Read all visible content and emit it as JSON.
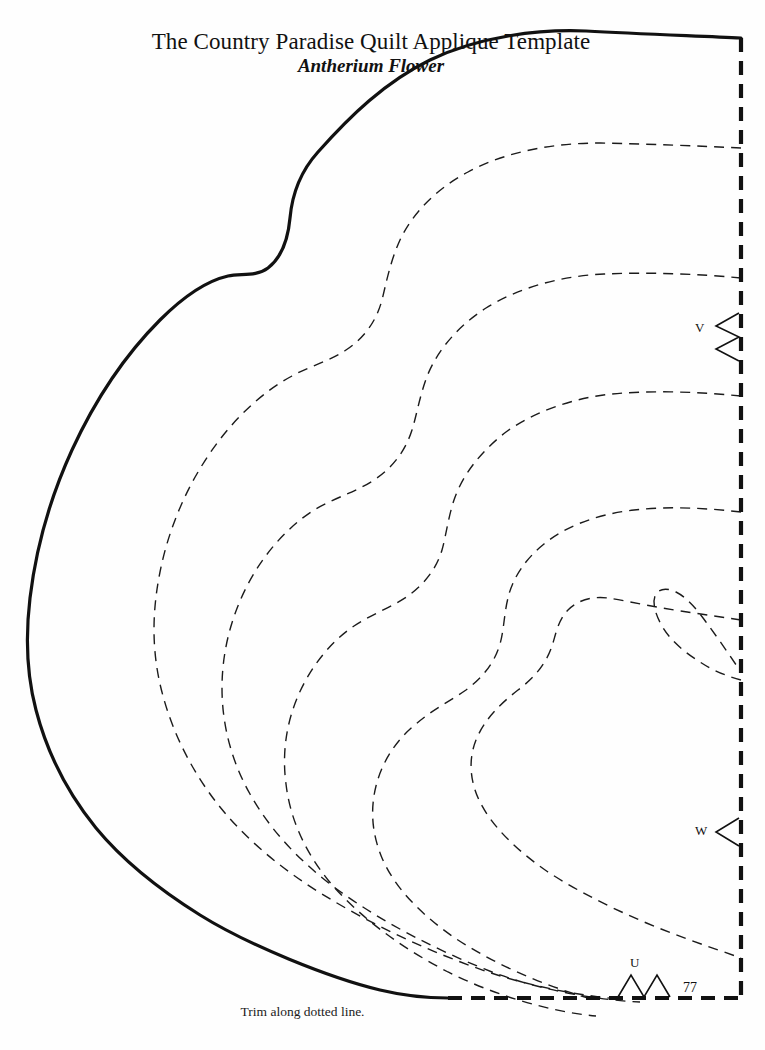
{
  "document": {
    "title_main": "The Country Paradise Quilt Applique Template",
    "title_sub": "Antherium Flower",
    "trim_caption": "Trim along dotted line.",
    "page_number": "77",
    "background_color": "#fefefe",
    "ink_color": "#111111"
  },
  "markers": [
    {
      "id": "V",
      "label": "V",
      "notches": 2,
      "edge": "right"
    },
    {
      "id": "W",
      "label": "W",
      "notches": 1,
      "edge": "right"
    },
    {
      "id": "U",
      "label": "U",
      "notches": 2,
      "edge": "bottom"
    }
  ],
  "template": {
    "cut_line_style": "solid",
    "trim_line_style": "dashed",
    "stitch_line_style": "dashed",
    "cut_line_width_px": 3.2,
    "trim_line_width_px": 4.0,
    "stitch_line_width_px": 1.4,
    "trim_dash_pattern": "14 9",
    "stitch_dash_pattern": "10 7",
    "contour_count": 6
  }
}
